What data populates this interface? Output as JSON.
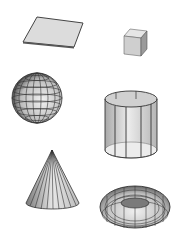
{
  "scene": {
    "background": "#ffffff",
    "shapes": [
      {
        "name": "plane",
        "label": "Plane"
      },
      {
        "name": "cube",
        "label": "Cube"
      },
      {
        "name": "sphere",
        "label": "Sphere"
      },
      {
        "name": "cylinder",
        "label": "Cylinder"
      },
      {
        "name": "cone",
        "label": "Cone"
      },
      {
        "name": "torus",
        "label": "Torus"
      }
    ],
    "colors": {
      "fill_light": "#e6e6e6",
      "fill_mid": "#c8c8c8",
      "fill_dark": "#8a8a8a",
      "edge": "#333333"
    }
  }
}
